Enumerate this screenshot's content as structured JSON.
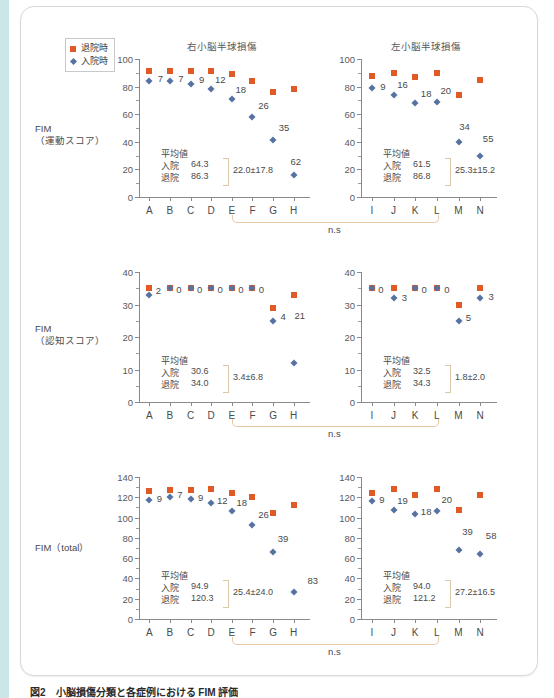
{
  "legend": {
    "items": [
      {
        "label": "退院時",
        "marker": "square-marker",
        "color": "#e05a25"
      },
      {
        "label": "入院時",
        "marker": "diamond-marker",
        "color": "#5572a0"
      }
    ]
  },
  "panel_titles": {
    "left": "右小脳半球損傷",
    "right": "左小脳半球損傷"
  },
  "row_labels": {
    "motor": "FIM\n（運動スコア）",
    "cognitive": "FIM\n（認知スコア）",
    "total": "FIM（total）"
  },
  "mean_box": {
    "title": "平均値",
    "admission_key": "入院",
    "discharge_key": "退院"
  },
  "significance_label": "n.s",
  "caption": "図2　小脳損傷分類と各症例における FIM 評価",
  "chart_data": [
    {
      "type": "scatter",
      "id": "motor-right-cerebellum",
      "title": "右小脳半球損傷",
      "ylabel": "FIM（運動スコア）",
      "xlabel": "",
      "categories": [
        "A",
        "B",
        "C",
        "D",
        "E",
        "F",
        "G",
        "H"
      ],
      "ylim": [
        0,
        100
      ],
      "yticks": [
        0,
        20,
        40,
        60,
        80,
        100
      ],
      "grid": false,
      "legend_position": "top-left",
      "series": [
        {
          "name": "退院時",
          "color": "#e05a25",
          "marker": "square",
          "values": [
            91,
            91,
            91,
            91,
            89,
            84,
            76,
            78
          ]
        },
        {
          "name": "入院時",
          "color": "#5572a0",
          "marker": "diamond",
          "values": [
            84,
            84,
            82,
            78,
            71,
            58,
            41,
            16
          ]
        }
      ],
      "point_labels": [
        "7",
        "7",
        "9",
        "12",
        "18",
        "26",
        "35",
        "62"
      ],
      "mean_admission": "64.3",
      "mean_discharge": "86.3",
      "difference": "22.0±17.8"
    },
    {
      "type": "scatter",
      "id": "motor-left-cerebellum",
      "title": "左小脳半球損傷",
      "ylabel": "FIM（運動スコア）",
      "xlabel": "",
      "categories": [
        "I",
        "J",
        "K",
        "L",
        "M",
        "N"
      ],
      "ylim": [
        0,
        100
      ],
      "yticks": [
        0,
        20,
        40,
        60,
        80,
        100
      ],
      "grid": false,
      "series": [
        {
          "name": "退院時",
          "color": "#e05a25",
          "marker": "square",
          "values": [
            88,
            90,
            87,
            90,
            74,
            85
          ]
        },
        {
          "name": "入院時",
          "color": "#5572a0",
          "marker": "diamond",
          "values": [
            79,
            74,
            68,
            69,
            40,
            30
          ]
        }
      ],
      "point_labels": [
        "9",
        "16",
        "18",
        "20",
        "34",
        "55"
      ],
      "mean_admission": "61.5",
      "mean_discharge": "86.8",
      "difference": "25.3±15.2"
    },
    {
      "type": "scatter",
      "id": "cognitive-right-cerebellum",
      "title": "右小脳半球損傷",
      "ylabel": "FIM（認知スコア）",
      "xlabel": "",
      "categories": [
        "A",
        "B",
        "C",
        "D",
        "E",
        "F",
        "G",
        "H"
      ],
      "ylim": [
        0,
        40
      ],
      "yticks": [
        0,
        10,
        20,
        30,
        40
      ],
      "grid": false,
      "series": [
        {
          "name": "退院時",
          "color": "#e05a25",
          "marker": "square",
          "values": [
            35,
            35,
            35,
            35,
            35,
            35,
            29,
            33
          ]
        },
        {
          "name": "入院時",
          "color": "#5572a0",
          "marker": "diamond",
          "values": [
            33,
            35,
            35,
            35,
            35,
            35,
            25,
            12
          ]
        }
      ],
      "point_labels": [
        "2",
        "0",
        "0",
        "0",
        "0",
        "0",
        "4",
        "21"
      ],
      "mean_admission": "30.6",
      "mean_discharge": "34.0",
      "difference": "3.4±6.8"
    },
    {
      "type": "scatter",
      "id": "cognitive-left-cerebellum",
      "title": "左小脳半球損傷",
      "ylabel": "FIM（認知スコア）",
      "xlabel": "",
      "categories": [
        "I",
        "J",
        "K",
        "L",
        "M",
        "N"
      ],
      "ylim": [
        0,
        40
      ],
      "yticks": [
        0,
        10,
        20,
        30,
        40
      ],
      "grid": false,
      "series": [
        {
          "name": "退院時",
          "color": "#e05a25",
          "marker": "square",
          "values": [
            35,
            35,
            35,
            35,
            30,
            35
          ]
        },
        {
          "name": "入院時",
          "color": "#5572a0",
          "marker": "diamond",
          "values": [
            35,
            32,
            35,
            35,
            25,
            32
          ]
        }
      ],
      "point_labels": [
        "0",
        "3",
        "0",
        "0",
        "5",
        "3"
      ],
      "mean_admission": "32.5",
      "mean_discharge": "34.3",
      "difference": "1.8±2.0"
    },
    {
      "type": "scatter",
      "id": "total-right-cerebellum",
      "title": "右小脳半球損傷",
      "ylabel": "FIM（total）",
      "xlabel": "",
      "categories": [
        "A",
        "B",
        "C",
        "D",
        "E",
        "F",
        "G",
        "H"
      ],
      "ylim": [
        0,
        140
      ],
      "yticks": [
        0,
        20,
        40,
        60,
        80,
        100,
        120,
        140
      ],
      "grid": false,
      "series": [
        {
          "name": "退院時",
          "color": "#e05a25",
          "marker": "square",
          "values": [
            126,
            127,
            127,
            128,
            124,
            120,
            105,
            112
          ]
        },
        {
          "name": "入院時",
          "color": "#5572a0",
          "marker": "diamond",
          "values": [
            117,
            120,
            118,
            114,
            106,
            93,
            66,
            27
          ]
        }
      ],
      "point_labels": [
        "9",
        "7",
        "9",
        "12",
        "18",
        "26",
        "39",
        "83"
      ],
      "mean_admission": "94.9",
      "mean_discharge": "120.3",
      "difference": "25.4±24.0"
    },
    {
      "type": "scatter",
      "id": "total-left-cerebellum",
      "title": "左小脳半球損傷",
      "ylabel": "FIM（total）",
      "xlabel": "",
      "categories": [
        "I",
        "J",
        "K",
        "L",
        "M",
        "N"
      ],
      "ylim": [
        0,
        140
      ],
      "yticks": [
        0,
        20,
        40,
        60,
        80,
        100,
        120,
        140
      ],
      "grid": false,
      "series": [
        {
          "name": "退院時",
          "color": "#e05a25",
          "marker": "square",
          "values": [
            124,
            128,
            122,
            128,
            107,
            122
          ]
        },
        {
          "name": "入院時",
          "color": "#5572a0",
          "marker": "diamond",
          "values": [
            116,
            107,
            104,
            106,
            68,
            64
          ]
        }
      ],
      "point_labels": [
        "9",
        "19",
        "18",
        "20",
        "39",
        "58"
      ],
      "mean_admission": "94.0",
      "mean_discharge": "121.2",
      "difference": "27.2±16.5"
    }
  ]
}
